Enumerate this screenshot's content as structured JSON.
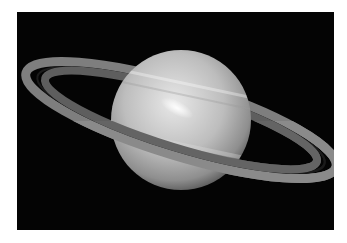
{
  "image": {
    "subject": "Saturn with rings",
    "background_color": "#040404",
    "page_color": "#ffffff",
    "planet_colors": {
      "light": "#e6e6e6",
      "mid": "#b8b8b8",
      "dark": "#6a6a6a"
    },
    "ring_colors": {
      "outer": "#8a8a8a",
      "inner": "#5c5c5c",
      "gap": "#1a1a1a"
    }
  }
}
